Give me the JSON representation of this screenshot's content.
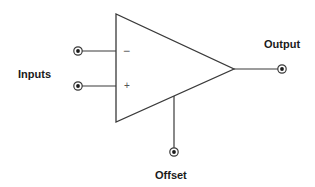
{
  "diagram": {
    "labels": {
      "inputs": "Inputs",
      "output": "Output",
      "offset": "Offset"
    },
    "input_signs": {
      "inverting": "−",
      "non_inverting": "+"
    },
    "colors": {
      "stroke": "#3a3a3a",
      "text": "#1a1a1a",
      "background": "#ffffff"
    },
    "geometry": {
      "triangle": [
        [
          116,
          14
        ],
        [
          116,
          122
        ],
        [
          234,
          69
        ]
      ],
      "pins": {
        "inverting_input": [
          78,
          51
        ],
        "non_inverting_input": [
          78,
          86
        ],
        "output": [
          282,
          69
        ],
        "offset": [
          174,
          152
        ]
      }
    }
  }
}
